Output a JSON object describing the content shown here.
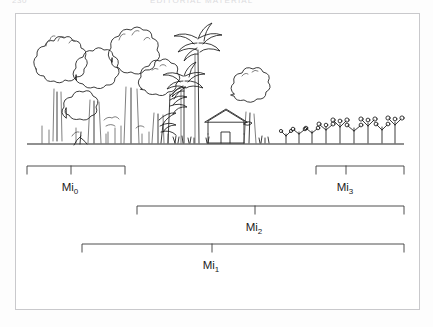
{
  "page": {
    "folio": "230",
    "running_head": "EDITORIAL MATERIAL"
  },
  "figure": {
    "caption": "",
    "ground_label": ""
  },
  "brackets": [
    {
      "id": "mi0",
      "label": "Mi",
      "subscript": "0",
      "full_label": "Mi0",
      "x_start": 11,
      "x_end": 109,
      "tick_x": 55,
      "y": 18,
      "label_x": 54,
      "label_y": 41,
      "describes": "primary-forest-zone"
    },
    {
      "id": "mi3",
      "label": "Mi",
      "subscript": "3",
      "full_label": "Mi3",
      "x_start": 300,
      "x_end": 388,
      "tick_x": 330,
      "y": 18,
      "label_x": 329,
      "label_y": 41,
      "describes": "cropland-fallow-zone"
    },
    {
      "id": "mi2",
      "label": "Mi",
      "subscript": "2",
      "full_label": "Mi2",
      "x_start": 121,
      "x_end": 388,
      "tick_x": 239,
      "y": 58,
      "label_x": 238,
      "label_y": 81,
      "describes": "agroforest-to-cropland-zone"
    },
    {
      "id": "mi1",
      "label": "Mi",
      "subscript": "1",
      "full_label": "Mi1",
      "x_start": 66,
      "x_end": 388,
      "tick_x": 196,
      "y": 96,
      "label_x": 195,
      "label_y": 119,
      "describes": "whole-gradient-zone"
    }
  ],
  "scene": {
    "ground_line": {
      "x_start": 11,
      "x_end": 388,
      "y": 138
    },
    "elements": [
      {
        "name": "broadleaf-forest",
        "region": "left"
      },
      {
        "name": "palm-trees",
        "region": "center-left"
      },
      {
        "name": "house",
        "region": "center"
      },
      {
        "name": "shade-tree",
        "region": "center-right"
      },
      {
        "name": "grass-tufts",
        "region": "center"
      },
      {
        "name": "crop-shrubs",
        "region": "right"
      }
    ]
  },
  "colors": {
    "ink": "#1a1a1a",
    "frame": "#c9c9cc",
    "paper": "#ffffff",
    "label": "#222222"
  }
}
